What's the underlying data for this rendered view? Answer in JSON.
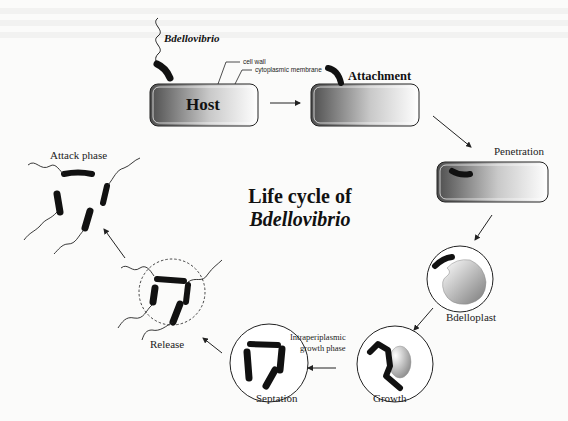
{
  "diagram": {
    "title_line1": "Life cycle of",
    "title_line2": "Bdellovibrio",
    "organism_label": "Bdellovibrio",
    "host_label": "Host",
    "annotations": {
      "cell_wall": "cell wall",
      "cytoplasmic_membrane": "cytoplasmic membrane"
    },
    "stages": [
      {
        "id": "attachment",
        "label": "Attachment"
      },
      {
        "id": "penetration",
        "label": "Penetration"
      },
      {
        "id": "bdelloplast",
        "label": "Bdelloplast"
      },
      {
        "id": "growth",
        "label": "Growth"
      },
      {
        "id": "intraperiplasmic",
        "label_line1": "Intraperiplasmic",
        "label_line2": "growth phase"
      },
      {
        "id": "septation",
        "label": "Septation"
      },
      {
        "id": "release",
        "label": "Release"
      },
      {
        "id": "attack",
        "label": "Attack phase"
      }
    ],
    "colors": {
      "background": "#fbfbfa",
      "ink": "#111111",
      "cell_gradient_dark": "#555555",
      "cell_gradient_light": "#ffffff"
    }
  }
}
